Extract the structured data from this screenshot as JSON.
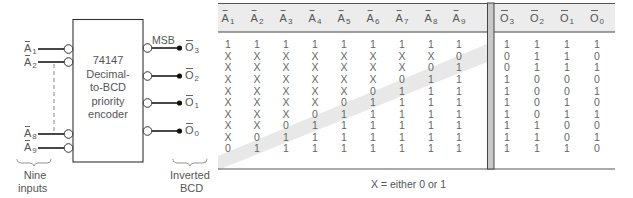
{
  "diagram": {
    "chip": {
      "lines": [
        "74147",
        "Decimal-",
        "to-BCD",
        "priority",
        "encoder"
      ]
    },
    "inputs": [
      {
        "letter": "A",
        "sub": "1"
      },
      {
        "letter": "A",
        "sub": "2"
      },
      {
        "letter": "A",
        "sub": "8"
      },
      {
        "letter": "A",
        "sub": "9"
      }
    ],
    "outputs": [
      {
        "letter": "O",
        "sub": "3"
      },
      {
        "letter": "O",
        "sub": "2"
      },
      {
        "letter": "O",
        "sub": "1"
      },
      {
        "letter": "O",
        "sub": "0"
      }
    ],
    "msb_label": "MSB",
    "inputs_caption": [
      "Nine",
      "inputs"
    ],
    "outputs_caption": [
      "Inverted",
      "BCD"
    ]
  },
  "truth_table": {
    "input_headers": [
      {
        "letter": "A",
        "sub": "1"
      },
      {
        "letter": "A",
        "sub": "2"
      },
      {
        "letter": "A",
        "sub": "3"
      },
      {
        "letter": "A",
        "sub": "4"
      },
      {
        "letter": "A",
        "sub": "5"
      },
      {
        "letter": "A",
        "sub": "6"
      },
      {
        "letter": "A",
        "sub": "7"
      },
      {
        "letter": "A",
        "sub": "8"
      },
      {
        "letter": "A",
        "sub": "9"
      }
    ],
    "output_headers": [
      {
        "letter": "O",
        "sub": "3"
      },
      {
        "letter": "O",
        "sub": "2"
      },
      {
        "letter": "O",
        "sub": "1"
      },
      {
        "letter": "O",
        "sub": "0"
      }
    ],
    "rows": [
      {
        "inputs": [
          "1",
          "1",
          "1",
          "1",
          "1",
          "1",
          "1",
          "1",
          "1"
        ],
        "outputs": [
          "1",
          "1",
          "1",
          "1"
        ]
      },
      {
        "inputs": [
          "X",
          "X",
          "X",
          "X",
          "X",
          "X",
          "X",
          "X",
          "0"
        ],
        "outputs": [
          "0",
          "1",
          "1",
          "0"
        ]
      },
      {
        "inputs": [
          "X",
          "X",
          "X",
          "X",
          "X",
          "X",
          "X",
          "0",
          "1"
        ],
        "outputs": [
          "0",
          "1",
          "1",
          "1"
        ]
      },
      {
        "inputs": [
          "X",
          "X",
          "X",
          "X",
          "X",
          "X",
          "0",
          "1",
          "1"
        ],
        "outputs": [
          "1",
          "0",
          "0",
          "0"
        ]
      },
      {
        "inputs": [
          "X",
          "X",
          "X",
          "X",
          "X",
          "0",
          "1",
          "1",
          "1"
        ],
        "outputs": [
          "1",
          "0",
          "0",
          "1"
        ]
      },
      {
        "inputs": [
          "X",
          "X",
          "X",
          "X",
          "0",
          "1",
          "1",
          "1",
          "1"
        ],
        "outputs": [
          "1",
          "0",
          "1",
          "0"
        ]
      },
      {
        "inputs": [
          "X",
          "X",
          "X",
          "0",
          "1",
          "1",
          "1",
          "1",
          "1"
        ],
        "outputs": [
          "1",
          "0",
          "1",
          "1"
        ]
      },
      {
        "inputs": [
          "X",
          "X",
          "0",
          "1",
          "1",
          "1",
          "1",
          "1",
          "1"
        ],
        "outputs": [
          "1",
          "1",
          "0",
          "0"
        ]
      },
      {
        "inputs": [
          "X",
          "0",
          "1",
          "1",
          "1",
          "1",
          "1",
          "1",
          "1"
        ],
        "outputs": [
          "1",
          "1",
          "0",
          "1"
        ]
      },
      {
        "inputs": [
          "0",
          "1",
          "1",
          "1",
          "1",
          "1",
          "1",
          "1",
          "1"
        ],
        "outputs": [
          "1",
          "1",
          "1",
          "0"
        ]
      }
    ],
    "footnote": "X = either 0 or 1"
  },
  "colors": {
    "line": "#333333",
    "header_bg": "#ececec",
    "divider_bg": "#c8c8c8",
    "highlight_band": "#e6e6e6"
  }
}
